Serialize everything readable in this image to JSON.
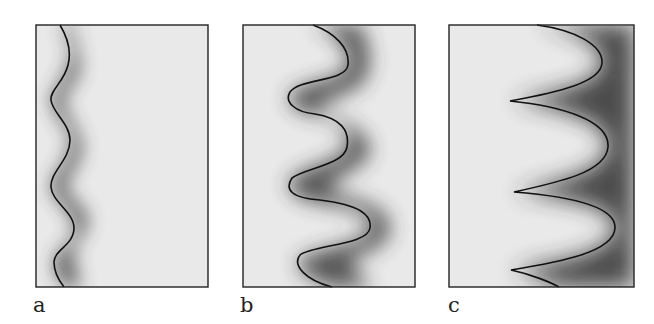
{
  "figure": {
    "panels": [
      {
        "label": "a",
        "description": "low-amplitude wavy front with soft shading on right side"
      },
      {
        "label": "b",
        "description": "larger-amplitude sinusoidal front with dark shading behind troughs"
      },
      {
        "label": "c",
        "description": "cusped front with sharp tips pointing left and dark shading"
      }
    ]
  },
  "colors": {
    "background": "#e9e9e9",
    "frame": "#222222",
    "curve": "#111111",
    "shade": "#3a3a3a"
  }
}
